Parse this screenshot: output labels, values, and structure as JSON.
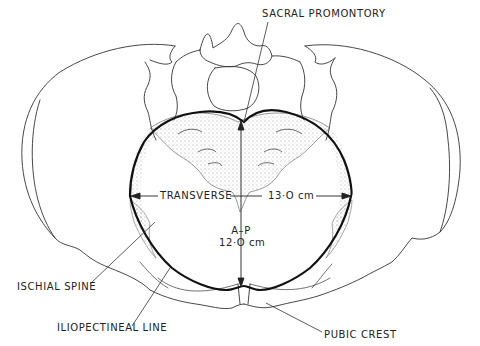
{
  "diagram": {
    "colors": {
      "line": "#222222",
      "stipple": "#9a9a9a",
      "background": "#ffffff"
    },
    "labels": {
      "sacral_promontory": "SACRAL PROMONTORY",
      "transverse": "TRANSVERSE",
      "transverse_value": "13·O cm",
      "ap_title": "A–P",
      "ap_value": "12·O cm",
      "ischial_spine": "ISCHIAL SPINE",
      "iliopectineal_line": "ILIOPECTINEAL LINE",
      "pubic_crest": "PUBIC CREST"
    },
    "measurements": [
      {
        "name": "Transverse diameter",
        "value": 13.0,
        "unit": "cm"
      },
      {
        "name": "Anterior-posterior diameter",
        "value": 12.0,
        "unit": "cm"
      }
    ]
  }
}
